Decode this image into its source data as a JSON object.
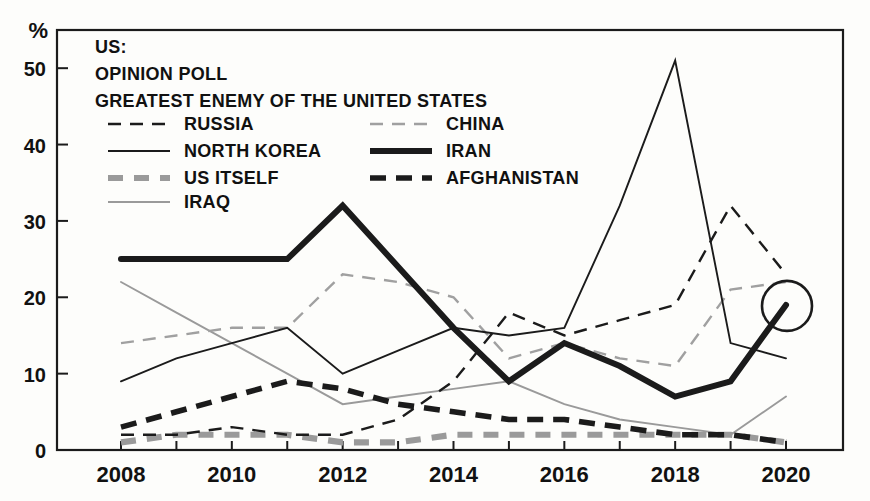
{
  "header": {
    "source_label": "US:",
    "subtitle": "OPINION POLL",
    "topic": "GREATEST ENEMY OF THE UNITED STATES"
  },
  "axes": {
    "y_unit": "%",
    "y_ticks": [
      "0",
      "10",
      "20",
      "30",
      "40",
      "50"
    ],
    "x_ticks": [
      "2008",
      "2010",
      "2012",
      "2014",
      "2016",
      "2018",
      "2020"
    ],
    "y_min": 0,
    "y_max": 55,
    "x_min": 2008,
    "x_max": 2020
  },
  "annotation": {
    "highlight_marker": "circle-highlight",
    "highlight_series": "IRAN",
    "highlight_year": 2020,
    "highlight_value": 19
  },
  "colors": {
    "ink": "#1b1b1b",
    "grey": "#8f8f8f",
    "paper": "#fdfdfb"
  },
  "legend": {
    "columns": [
      [
        {
          "label": "RUSSIA",
          "style": "dashed-thin",
          "color": "#1b1b1b"
        },
        {
          "label": "NORTH KOREA",
          "style": "solid-thin",
          "color": "#1b1b1b"
        },
        {
          "label": "US ITSELF",
          "style": "dashed-thick-grey",
          "color": "#8f8f8f"
        },
        {
          "label": "IRAQ",
          "style": "solid-thin-grey",
          "color": "#8f8f8f"
        }
      ],
      [
        {
          "label": "CHINA",
          "style": "dashed-thin-grey",
          "color": "#8f8f8f"
        },
        {
          "label": "IRAN",
          "style": "solid-thick",
          "color": "#1b1b1b"
        },
        {
          "label": "AFGHANISTAN",
          "style": "dashed-thick",
          "color": "#1b1b1b"
        }
      ]
    ]
  },
  "chart_data": {
    "type": "line",
    "xlabel": "",
    "ylabel": "%",
    "ylim": [
      0,
      55
    ],
    "xlim": [
      2008,
      2020
    ],
    "grid": false,
    "legend_position": "top-inside",
    "x": [
      2008,
      2009,
      2010,
      2011,
      2012,
      2013,
      2014,
      2015,
      2016,
      2017,
      2018,
      2019,
      2020
    ],
    "series": [
      {
        "name": "IRAN",
        "style": "solid-thick",
        "color": "#1b1b1b",
        "values": [
          25,
          25,
          25,
          25,
          32,
          24,
          16,
          9,
          14,
          11,
          7,
          9,
          19
        ]
      },
      {
        "name": "NORTH KOREA",
        "style": "solid-thin",
        "color": "#1b1b1b",
        "values": [
          9,
          12,
          14,
          16,
          10,
          13,
          16,
          15,
          16,
          32,
          51,
          14,
          12
        ]
      },
      {
        "name": "CHINA",
        "style": "dashed-thin-grey",
        "color": "#8f8f8f",
        "values": [
          14,
          15,
          16,
          16,
          23,
          22,
          20,
          12,
          14,
          12,
          11,
          21,
          22
        ]
      },
      {
        "name": "RUSSIA",
        "style": "dashed-thin",
        "color": "#1b1b1b",
        "values": [
          2,
          2,
          3,
          2,
          2,
          4,
          9,
          18,
          15,
          17,
          19,
          32,
          23
        ]
      },
      {
        "name": "AFGHANISTAN",
        "style": "dashed-thick",
        "color": "#1b1b1b",
        "values": [
          3,
          5,
          7,
          9,
          8,
          6,
          5,
          4,
          4,
          3,
          2,
          2,
          1
        ]
      },
      {
        "name": "IRAQ",
        "style": "solid-thin-grey",
        "color": "#8f8f8f",
        "values": [
          22,
          18,
          14,
          10,
          6,
          7,
          8,
          9,
          6,
          4,
          3,
          2,
          7
        ]
      },
      {
        "name": "US ITSELF",
        "style": "dashed-thick-grey",
        "color": "#8f8f8f",
        "values": [
          1,
          2,
          2,
          2,
          1,
          1,
          2,
          2,
          2,
          2,
          2,
          2,
          1
        ]
      }
    ]
  }
}
